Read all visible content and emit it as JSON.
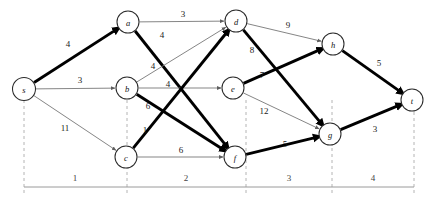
{
  "figure": {
    "title": "",
    "type": "directed-weighted-graph"
  },
  "graph_data": {
    "type": "diagram",
    "directed": true,
    "nodes": [
      {
        "id": "s",
        "label": "s",
        "x": 24,
        "y": 89,
        "r": 11.5
      },
      {
        "id": "a",
        "label": "a",
        "x": 128,
        "y": 22,
        "r": 11.0
      },
      {
        "id": "b",
        "label": "b",
        "x": 127,
        "y": 88,
        "r": 11.0
      },
      {
        "id": "c",
        "label": "c",
        "x": 126,
        "y": 157,
        "r": 11.0
      },
      {
        "id": "d",
        "label": "d",
        "x": 236,
        "y": 21,
        "r": 11.0
      },
      {
        "id": "e",
        "label": "e",
        "x": 233,
        "y": 88,
        "r": 11.0
      },
      {
        "id": "f",
        "label": "f",
        "x": 235,
        "y": 157,
        "r": 11.0
      },
      {
        "id": "g",
        "label": "g",
        "x": 330,
        "y": 134,
        "r": 11.0
      },
      {
        "id": "h",
        "label": "h",
        "x": 333,
        "y": 44,
        "r": 11.0
      },
      {
        "id": "t",
        "label": "t",
        "x": 412,
        "y": 100,
        "r": 11.0
      }
    ],
    "edges": [
      {
        "from": "s",
        "to": "a",
        "weight": "4",
        "style": "thick",
        "lx": 68,
        "ly": 44
      },
      {
        "from": "s",
        "to": "b",
        "weight": "3",
        "style": "thin",
        "lx": 80,
        "ly": 80
      },
      {
        "from": "s",
        "to": "c",
        "weight": "11",
        "style": "thin",
        "lx": 65,
        "ly": 128
      },
      {
        "from": "a",
        "to": "d",
        "weight": "3",
        "style": "thin",
        "lx": 183,
        "ly": 14
      },
      {
        "from": "a",
        "to": "f",
        "weight": "4",
        "style": "thick",
        "lx": 162,
        "ly": 35
      },
      {
        "from": "b",
        "to": "d",
        "weight": "4",
        "style": "thin",
        "lx": 153,
        "ly": 66
      },
      {
        "from": "b",
        "to": "e",
        "weight": "4",
        "style": "thin",
        "lx": 168,
        "ly": 84
      },
      {
        "from": "b",
        "to": "f",
        "weight": "6",
        "style": "thick",
        "lx": 148,
        "ly": 106
      },
      {
        "from": "c",
        "to": "d",
        "weight": "1",
        "style": "thick",
        "lx": 145,
        "ly": 130
      },
      {
        "from": "c",
        "to": "f",
        "weight": "6",
        "style": "thin",
        "lx": 181,
        "ly": 150
      },
      {
        "from": "d",
        "to": "h",
        "weight": "9",
        "style": "thin",
        "lx": 288,
        "ly": 25
      },
      {
        "from": "d",
        "to": "g",
        "weight": "8",
        "style": "thick",
        "lx": 252,
        "ly": 50
      },
      {
        "from": "e",
        "to": "h",
        "weight": "7",
        "style": "thick",
        "lx": 262,
        "ly": 75
      },
      {
        "from": "e",
        "to": "g",
        "weight": "12",
        "style": "thin",
        "lx": 264,
        "ly": 111
      },
      {
        "from": "f",
        "to": "g",
        "weight": "5",
        "style": "thick",
        "lx": 285,
        "ly": 144
      },
      {
        "from": "g",
        "to": "t",
        "weight": "3",
        "style": "thick",
        "lx": 375,
        "ly": 129
      },
      {
        "from": "h",
        "to": "t",
        "weight": "5",
        "style": "thick",
        "lx": 379,
        "ly": 63
      }
    ],
    "axis": {
      "line_y": 187,
      "x_start": 24,
      "x_end": 414,
      "ticks": [
        {
          "x": 24,
          "y_top": 100,
          "y_bottom": 194
        },
        {
          "x": 127,
          "y_top": 100,
          "y_bottom": 194
        },
        {
          "x": 246,
          "y_top": 100,
          "y_bottom": 194
        },
        {
          "x": 332,
          "y_top": 100,
          "y_bottom": 194
        },
        {
          "x": 414,
          "y_top": 100,
          "y_bottom": 194
        }
      ],
      "segment_labels": [
        {
          "text": "1",
          "x": 75,
          "y": 178
        },
        {
          "text": "2",
          "x": 186,
          "y": 178
        },
        {
          "text": "3",
          "x": 289,
          "y": 178
        },
        {
          "text": "4",
          "x": 373,
          "y": 178
        }
      ]
    },
    "colors": {
      "thick_edge": "#000000",
      "thin_edge": "#6f6f6f",
      "node_stroke": "#2b2b2b",
      "node_fill": "#ffffff",
      "axis": "#9a9a9a",
      "tick": "#b4b4b4"
    }
  }
}
